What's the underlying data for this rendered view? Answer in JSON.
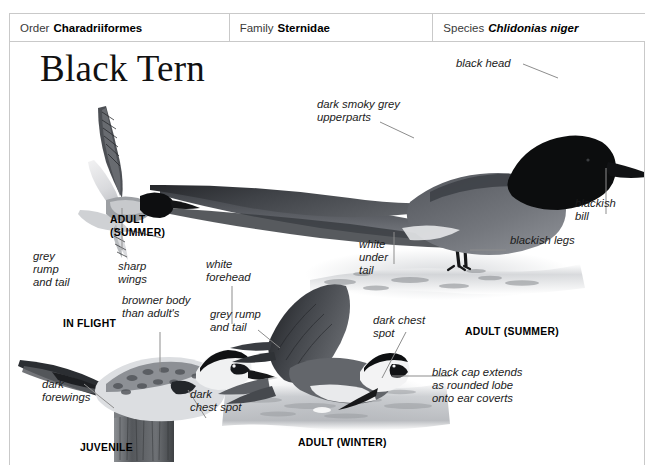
{
  "header": {
    "fields": [
      {
        "key": "Order",
        "value": "Charadriiformes",
        "italic": false
      },
      {
        "key": "Family",
        "value": "Sternidae",
        "italic": false
      },
      {
        "key": "Species",
        "value": "Chlidonias niger",
        "italic": true
      }
    ]
  },
  "plate": {
    "title": "Black Tern",
    "captions": [
      {
        "name": "caption-adult-summer-flight",
        "text": "ADULT\n(SUMMER)"
      },
      {
        "name": "caption-in-flight",
        "text": "IN FLIGHT"
      },
      {
        "name": "caption-juvenile",
        "text": "JUVENILE"
      },
      {
        "name": "caption-adult-winter",
        "text": "ADULT (WINTER)"
      },
      {
        "name": "caption-adult-summer",
        "text": "ADULT (SUMMER)"
      }
    ],
    "labels": [
      {
        "name": "label-black-head",
        "text": "black head"
      },
      {
        "name": "label-dark-smoky-grey",
        "text": "dark smoky grey\nupperparts"
      },
      {
        "name": "label-blackish-bill",
        "text": "blackish\nbill"
      },
      {
        "name": "label-blackish-legs",
        "text": "blackish legs"
      },
      {
        "name": "label-white-under-tail",
        "text": "white\nunder\ntail"
      },
      {
        "name": "label-grey-rump-tail-flight",
        "text": "grey\nrump\nand tail"
      },
      {
        "name": "label-sharp-wings",
        "text": "sharp\nwings"
      },
      {
        "name": "label-browner-body",
        "text": "browner body\nthan adult's"
      },
      {
        "name": "label-dark-forewings",
        "text": "dark\nforewings"
      },
      {
        "name": "label-dark-chest-spot-juv",
        "text": "dark\nchest spot"
      },
      {
        "name": "label-white-forehead",
        "text": "white\nforehead"
      },
      {
        "name": "label-grey-rump-tail-winter",
        "text": "grey rump\nand tail"
      },
      {
        "name": "label-dark-chest-spot-winter",
        "text": "dark chest\nspot"
      },
      {
        "name": "label-black-cap-extends",
        "text": "black cap extends\nas rounded lobe\nonto ear coverts"
      }
    ],
    "colors": {
      "border": "#c9c9c9",
      "leader": "#8d8d8d",
      "text": "#1b1b1b",
      "plumage_black": "#111111",
      "plumage_dark_grey": "#4a4d52",
      "plumage_mid_grey": "#8b8e93",
      "plumage_pale": "#dcdde0",
      "water": "#b9bcc0"
    }
  }
}
